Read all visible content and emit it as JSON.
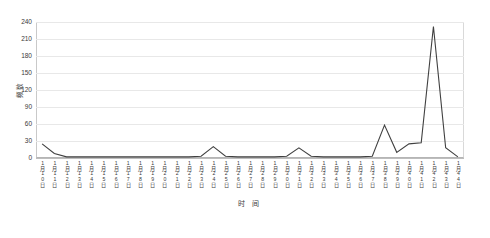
{
  "chart_data": {
    "type": "line",
    "title": "",
    "subtitle": "",
    "xlabel": "时 间",
    "ylabel": "频数",
    "ylim": [
      0,
      240
    ],
    "yticks": [
      0,
      30,
      60,
      90,
      120,
      150,
      180,
      210,
      240
    ],
    "grid": true,
    "legend_position": "none",
    "line_color": "#404040",
    "categories": [
      "1月10日",
      "1月11日",
      "1月12日",
      "1月13日",
      "1月14日",
      "1月15日",
      "1月16日",
      "1月17日",
      "1月18日",
      "1月19日",
      "1月20日",
      "1月21日",
      "1月22日",
      "1月23日",
      "1月24日",
      "1月25日",
      "1月26日",
      "1月27日",
      "1月28日",
      "1月29日",
      "1月30日",
      "1月31日",
      "1月32日",
      "1月33日",
      "1月34日",
      "1月35日",
      "1月36日",
      "1月37日",
      "1月38日",
      "1月39日",
      "1月40日",
      "1月41日",
      "1月42日",
      "1月43日",
      "1月44日"
    ],
    "series": [
      {
        "name": "频数",
        "values": [
          25,
          8,
          2,
          2,
          2,
          2,
          2,
          2,
          2,
          2,
          2,
          2,
          2,
          3,
          20,
          3,
          2,
          2,
          2,
          2,
          3,
          18,
          3,
          2,
          2,
          2,
          2,
          3,
          58,
          10,
          25,
          27,
          232,
          18,
          2
        ]
      }
    ],
    "annotations": [
      {
        "label": "peak",
        "x": "1月42日",
        "y": 232
      }
    ]
  },
  "caption": {
    "text": ""
  }
}
